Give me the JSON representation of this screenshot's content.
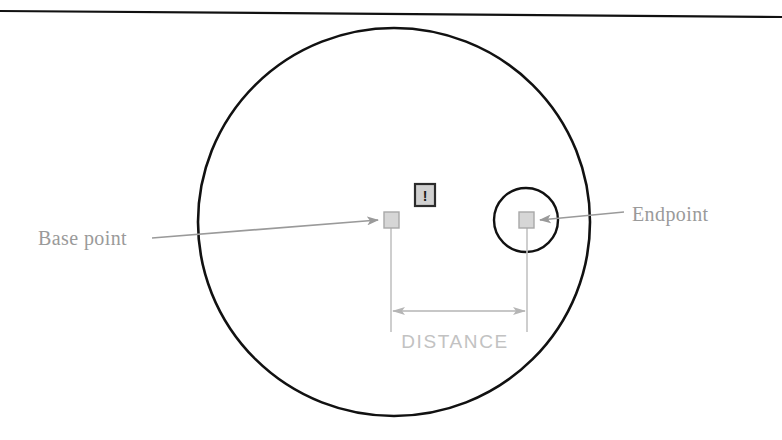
{
  "figure": {
    "type": "technical-diagram",
    "background_color": "#ffffff"
  },
  "colors": {
    "outline_black": "#111111",
    "leader_gray": "#9a9a9a",
    "label_gray": "#9a9a9a",
    "dimension_gray": "#c2c2c2",
    "marker_fill": "#d6d6d6",
    "marker_stroke": "#a8a8a8",
    "icon_border": "#2b2b2b",
    "icon_fill": "#d0d0d0"
  },
  "shapes": {
    "top_rule": {
      "name": "top-border-line",
      "x1": 0,
      "y1": 11,
      "x2": 782,
      "y2": 17,
      "stroke": "#111111",
      "stroke_width": 2.2
    },
    "main_circle": {
      "name": "main-circle",
      "cx": 394,
      "cy": 222,
      "rx": 196,
      "ry": 194,
      "stroke": "#111111",
      "stroke_width": 2.6,
      "fill": "none"
    },
    "aperture_circle": {
      "name": "snap-aperture-circle",
      "cx": 526,
      "cy": 220,
      "r": 32,
      "stroke": "#111111",
      "stroke_width": 2.4,
      "fill": "none"
    }
  },
  "markers": {
    "base_point": {
      "name": "base-point-marker",
      "x": 384,
      "y": 212,
      "w": 15,
      "h": 16,
      "label": "Base point"
    },
    "endpoint": {
      "name": "endpoint-marker",
      "x": 519,
      "y": 212,
      "w": 15,
      "h": 16,
      "label": "Endpoint"
    }
  },
  "icon": {
    "name": "warning-exclamation-icon",
    "glyph": "!",
    "x": 415,
    "y": 184,
    "w": 20,
    "h": 22
  },
  "labels": {
    "base_point": {
      "text": "Base point",
      "x": 38,
      "y": 245,
      "anchor": "start",
      "style": "serif"
    },
    "endpoint": {
      "text": "Endpoint",
      "x": 632,
      "y": 221,
      "anchor": "start",
      "style": "serif"
    },
    "distance": {
      "text": "DISTANCE",
      "x": 455,
      "y": 348,
      "anchor": "middle",
      "style": "sans"
    }
  },
  "leaders": {
    "base_point_leader": {
      "name": "base-point-leader-line",
      "x1": 152,
      "y1": 238,
      "x2": 381,
      "y2": 220,
      "arrow_at": "end"
    },
    "endpoint_leader": {
      "name": "endpoint-leader-line",
      "x1": 624,
      "y1": 212,
      "x2": 537,
      "y2": 220,
      "arrow_at": "end"
    }
  },
  "dimension": {
    "name": "distance-dimension",
    "extension_left": {
      "x": 391,
      "y1": 228,
      "y2": 330
    },
    "extension_right": {
      "x": 527,
      "y1": 228,
      "y2": 330
    },
    "dim_line": {
      "x1": 393,
      "x2": 525,
      "y": 311
    },
    "arrows": "both"
  }
}
